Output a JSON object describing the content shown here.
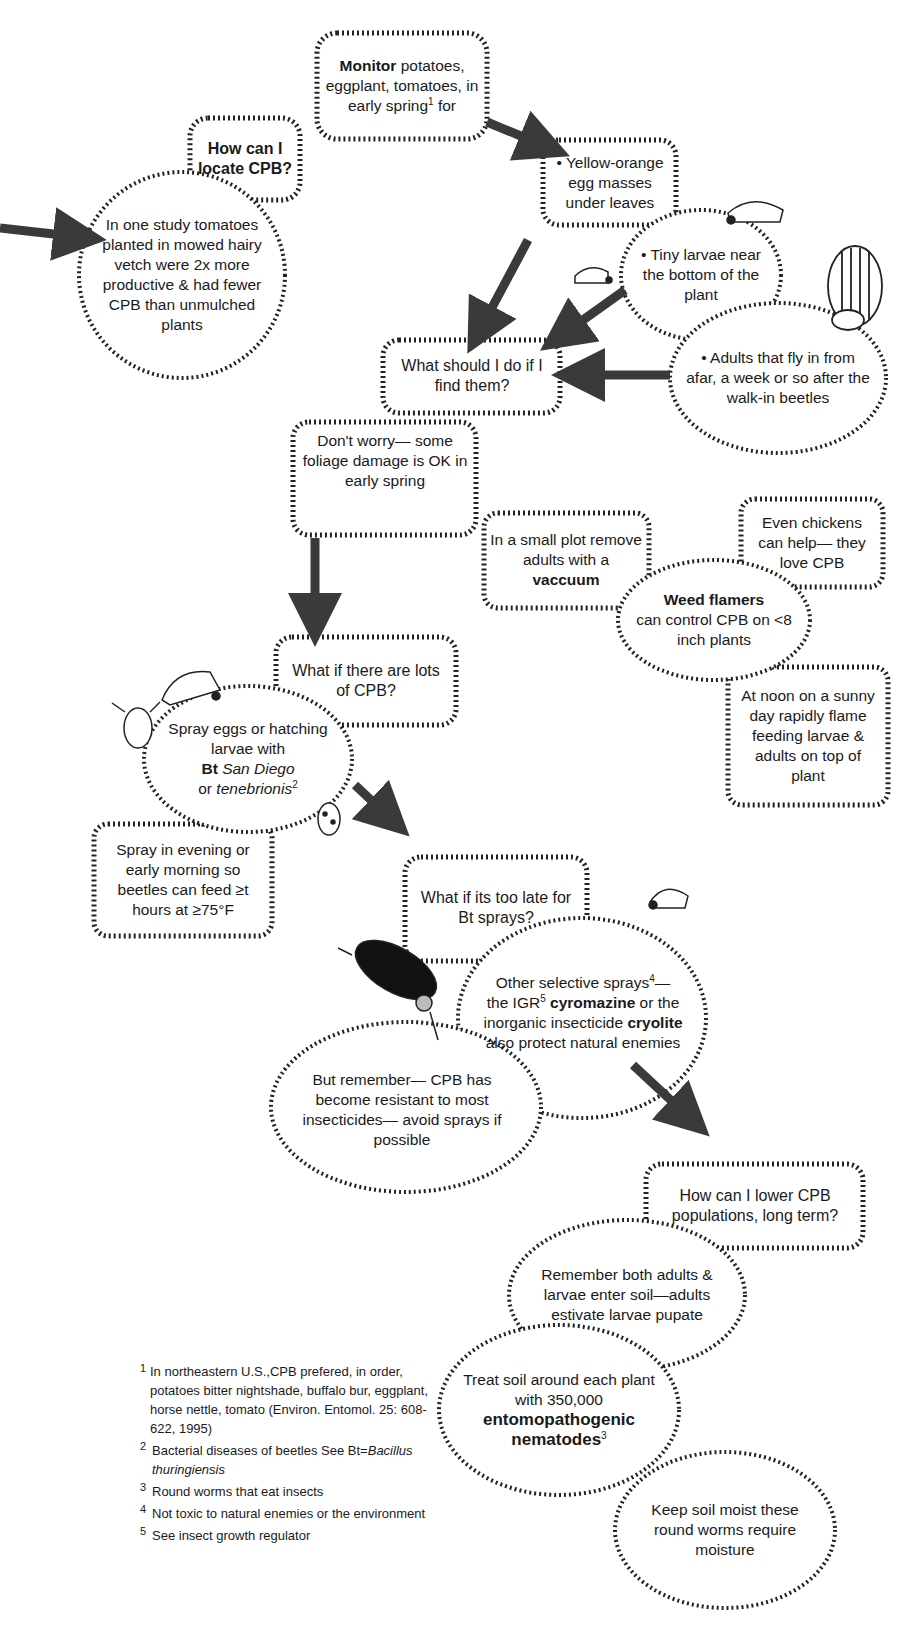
{
  "diagram": {
    "stroke_color": "#222222",
    "arrow_color": "#3a3a3a",
    "nodes": {
      "monitor": {
        "bold": "Monitor",
        "rest": " potatoes, eggplant, tomatoes, in early spring",
        "sup": "1",
        "tail": " for"
      },
      "locate": {
        "label": "How can I locate CPB?"
      },
      "vetch": {
        "label": "In one study tomatoes planted in mowed hairy vetch were 2x more productive & had fewer CPB than unmulched plants"
      },
      "eggs": {
        "label": "• Yellow-orange egg masses under leaves"
      },
      "larvae": {
        "label": "• Tiny larvae near the bottom of the plant"
      },
      "adults": {
        "label": "• Adults that fly in from afar, a week or so after the walk-in beetles"
      },
      "find": {
        "label": "What should I do if I find them?"
      },
      "dont_worry": {
        "label": "Don't worry— some foliage damage is OK in early spring"
      },
      "vacuum": {
        "pre": "In a small plot remove adults with a ",
        "bold": "vaccuum"
      },
      "chickens": {
        "label": "Even chickens can help— they love CPB"
      },
      "flamers": {
        "bold": "Weed flamers",
        "rest": "can control CPB on <8 inch plants"
      },
      "noon": {
        "label": "At noon on a sunny day rapidly flame feeding larvae & adults on top of plant"
      },
      "lots": {
        "label": "What if there are lots of CPB?"
      },
      "bt": {
        "pre": "Spray eggs or hatching larvae with",
        "bold": "Bt",
        "italic1": "San Diego",
        "or": "or ",
        "italic2": "tenebrionis",
        "sup": "2"
      },
      "evening": {
        "label": "Spray in evening or early morning so beetles can feed ≥t hours at ≥75°F"
      },
      "too_late": {
        "label": "What if its too late for Bt sprays?"
      },
      "selective": {
        "p1": "Other selective sprays",
        "sup1": "4",
        "p1b": "—",
        "p2": "the IGR",
        "sup2": "5",
        "bold1": "cyromazine",
        "p3": " or the",
        "p4": "inorganic insecticide ",
        "bold2": "cryolite",
        "p5": "also protect natural enemies"
      },
      "remember_resist": {
        "label": "But remember— CPB has become resistant to most insecticides— avoid sprays if possible"
      },
      "long_term": {
        "label": "How can I lower CPB populations, long term?"
      },
      "soil": {
        "label": "Remember both adults & larvae enter soil—adults estivate larvae pupate"
      },
      "nematodes": {
        "pre": "Treat soil around each plant with 350,000",
        "bold": "entomopathogenic nematodes",
        "sup": "3"
      },
      "moist": {
        "label": "Keep soil moist these round worms require moisture"
      }
    },
    "footnotes": [
      {
        "num": "1",
        "text": "In northeastern U.S.,CPB prefered, in order, potatoes bitter nightshade, buffalo bur, eggplant, horse nettle, tomato (Environ. Entomol. 25: 608-622, 1995)"
      },
      {
        "num": "2",
        "text": "Bacterial diseases of beetles See Bt=",
        "italic": "Bacillus thuringiensis"
      },
      {
        "num": "3",
        "text": "Round worms that eat insects"
      },
      {
        "num": "4",
        "text": "Not toxic to natural enemies or the environment"
      },
      {
        "num": "5",
        "text": "See insect growth regulator"
      }
    ]
  }
}
